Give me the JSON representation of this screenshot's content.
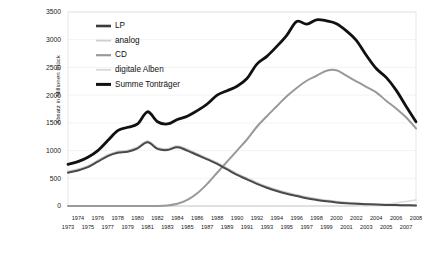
{
  "chart_data": {
    "type": "line",
    "title": "",
    "xlabel": "",
    "ylabel": "Absatz in Millionen Stück",
    "ylim": [
      0,
      3500
    ],
    "ytick_values": [
      0,
      500,
      1000,
      1500,
      2000,
      2500,
      3000,
      3500
    ],
    "ytick_labels": [
      "0",
      "500",
      "1000",
      "1500",
      "2000",
      "2500",
      "3000",
      "3500"
    ],
    "grid": true,
    "legend_position": "top-left inside",
    "x": [
      1973,
      1974,
      1975,
      1976,
      1977,
      1978,
      1979,
      1980,
      1981,
      1982,
      1983,
      1984,
      1985,
      1986,
      1987,
      1988,
      1989,
      1990,
      1991,
      1992,
      1993,
      1994,
      1995,
      1996,
      1997,
      1998,
      1999,
      2000,
      2001,
      2002,
      2003,
      2004,
      2005,
      2006,
      2007,
      2008
    ],
    "xtick_labels_top": [
      "1974",
      "1976",
      "1978",
      "1980",
      "1982",
      "1984",
      "1986",
      "1988",
      "1990",
      "1992",
      "1994",
      "1996",
      "1998",
      "2000",
      "2002",
      "2004",
      "2006",
      "2008"
    ],
    "xtick_labels_bottom": [
      "1973",
      "1975",
      "1977",
      "1979",
      "1981",
      "1983",
      "1985",
      "1987",
      "1989",
      "1991",
      "1993",
      "1995",
      "1997",
      "1999",
      "2001",
      "2003",
      "2005",
      "2007"
    ],
    "series": [
      {
        "name": "LP",
        "color": "#4a4a4a",
        "width": 2.0,
        "values": [
          600,
          640,
          700,
          800,
          900,
          960,
          980,
          1040,
          1150,
          1030,
          1010,
          1060,
          1000,
          920,
          840,
          760,
          660,
          560,
          480,
          400,
          330,
          270,
          220,
          180,
          140,
          110,
          85,
          65,
          50,
          40,
          32,
          26,
          20,
          16,
          13,
          10
        ]
      },
      {
        "name": "analog",
        "color": "#c9c9c9",
        "width": 1.8,
        "values": [
          620,
          660,
          720,
          820,
          920,
          980,
          1000,
          1060,
          1170,
          1050,
          1030,
          1080,
          1020,
          940,
          860,
          780,
          680,
          580,
          500,
          420,
          350,
          290,
          240,
          200,
          160,
          130,
          100,
          80,
          62,
          50,
          40,
          30,
          20,
          12,
          8,
          5
        ]
      },
      {
        "name": "CD",
        "color": "#999999",
        "width": 2.0,
        "values": [
          0,
          0,
          0,
          0,
          0,
          0,
          0,
          0,
          0,
          0,
          10,
          40,
          110,
          230,
          400,
          600,
          800,
          1000,
          1200,
          1430,
          1620,
          1800,
          1980,
          2130,
          2260,
          2350,
          2440,
          2450,
          2350,
          2250,
          2150,
          2050,
          1900,
          1760,
          1600,
          1400
        ]
      },
      {
        "name": "digitale Alben",
        "color": "#dcdcdc",
        "width": 1.6,
        "values": [
          0,
          0,
          0,
          0,
          0,
          0,
          0,
          0,
          0,
          0,
          0,
          0,
          0,
          0,
          0,
          0,
          0,
          0,
          0,
          0,
          0,
          0,
          0,
          0,
          0,
          0,
          0,
          0,
          0,
          5,
          12,
          22,
          35,
          55,
          80,
          110
        ]
      },
      {
        "name": "Summe Tonträger",
        "color": "#111111",
        "width": 2.8,
        "values": [
          750,
          800,
          880,
          1000,
          1180,
          1360,
          1420,
          1480,
          1700,
          1520,
          1480,
          1560,
          1620,
          1720,
          1840,
          2000,
          2080,
          2160,
          2300,
          2560,
          2700,
          2880,
          3080,
          3330,
          3280,
          3360,
          3340,
          3290,
          3160,
          2990,
          2720,
          2480,
          2320,
          2090,
          1800,
          1520
        ]
      }
    ],
    "legend_entries": [
      {
        "label": "LP",
        "color": "#3b3b3b",
        "width": 2.6
      },
      {
        "label": "analog",
        "color": "#cfcfcf",
        "width": 1.8
      },
      {
        "label": "CD",
        "color": "#9a9a9a",
        "width": 2.2
      },
      {
        "label": "digitale Alben",
        "color": "#d8d8d8",
        "width": 1.8
      },
      {
        "label": "Summe Tonträger",
        "color": "#111111",
        "width": 3.0
      }
    ]
  }
}
